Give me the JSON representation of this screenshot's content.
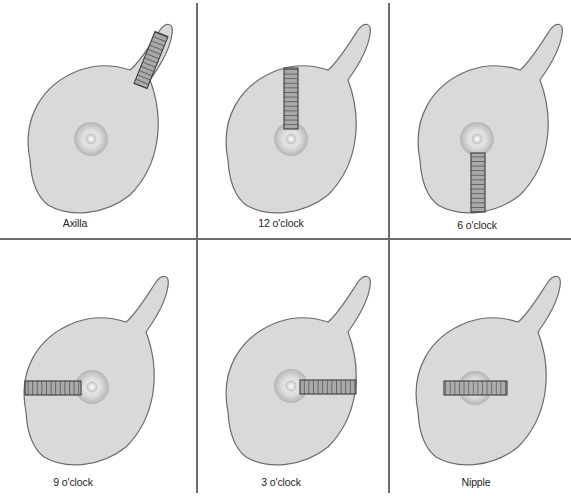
{
  "figure": {
    "colors": {
      "background": "#ffffff",
      "breast_fill": "#d9d9d9",
      "breast_outline": "#6b6b6b",
      "areola_light": "#ececec",
      "areola_dark": "#b8b8b8",
      "nipple": "#f2f2f2",
      "probe_fill": "#a8a8a8",
      "probe_outline": "#3c3c3c",
      "divider": "#6e6e6e"
    },
    "panels": [
      {
        "id": "axilla",
        "label": "Axilla",
        "row": 0,
        "col": 0,
        "probe_position": "axilla"
      },
      {
        "id": "12oclock",
        "label": "12 o'clock",
        "row": 0,
        "col": 1,
        "probe_position": "12"
      },
      {
        "id": "6oclock",
        "label": "6 o'clock",
        "row": 0,
        "col": 2,
        "probe_position": "6"
      },
      {
        "id": "9oclock",
        "label": "9 o'clock",
        "row": 1,
        "col": 0,
        "probe_position": "9"
      },
      {
        "id": "3oclock",
        "label": "3 o'clock",
        "row": 1,
        "col": 1,
        "probe_position": "3"
      },
      {
        "id": "nipple",
        "label": "Nipple",
        "row": 1,
        "col": 2,
        "probe_position": "nipple"
      }
    ]
  }
}
